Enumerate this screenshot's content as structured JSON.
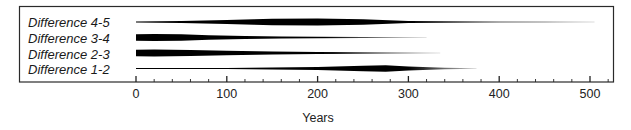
{
  "chart_data": {
    "type": "area",
    "subtype": "battleship / kite diagram",
    "title": "",
    "xlabel": "Years",
    "ylabel": "",
    "xlim": [
      0,
      530
    ],
    "x_ticks": [
      0,
      100,
      200,
      300,
      400,
      500
    ],
    "x_minor_step": 20,
    "grid": false,
    "legend": null,
    "series": [
      {
        "name": "Difference 4-5",
        "x": [
          0,
          50,
          100,
          150,
          200,
          250,
          300,
          350,
          400,
          450,
          505
        ],
        "width": [
          1.0,
          2.0,
          4.0,
          6.5,
          7.0,
          5.5,
          2.0,
          1.5,
          1.0,
          0.8,
          0.6
        ],
        "end": 505
      },
      {
        "name": "Difference 3-4",
        "x": [
          0,
          20,
          50,
          80,
          120,
          160,
          200,
          250,
          320
        ],
        "width": [
          6.5,
          7.0,
          6.5,
          4.5,
          3.0,
          2.0,
          1.5,
          1.0,
          0.6
        ],
        "end": 320
      },
      {
        "name": "Difference 2-3",
        "x": [
          0,
          20,
          60,
          100,
          150,
          200,
          250,
          300,
          335
        ],
        "width": [
          6.5,
          7.0,
          6.0,
          4.5,
          3.0,
          2.0,
          1.3,
          1.0,
          0.6
        ],
        "end": 335
      },
      {
        "name": "Difference 1-2",
        "x": [
          0,
          50,
          100,
          150,
          200,
          250,
          275,
          300,
          340,
          375
        ],
        "width": [
          0.8,
          1.0,
          1.2,
          1.8,
          3.0,
          5.5,
          6.5,
          4.0,
          1.5,
          0.6
        ],
        "end": 375
      }
    ]
  },
  "labels": {
    "rows": [
      "Difference 4-5",
      "Difference 3-4",
      "Difference 2-3",
      "Difference 1-2"
    ],
    "ticks": [
      "0",
      "100",
      "200",
      "300",
      "400",
      "500"
    ],
    "axis_title": "Years"
  }
}
